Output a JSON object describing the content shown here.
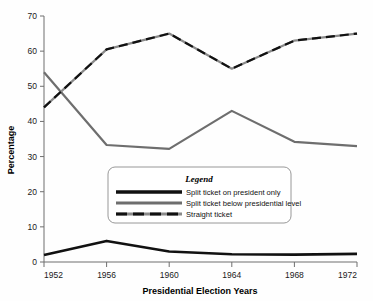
{
  "chart_data": {
    "type": "line",
    "title": "",
    "xlabel": "Presidential Election Years",
    "ylabel": "Percentage",
    "categories": [
      1952,
      1956,
      1960,
      1964,
      1968,
      1972
    ],
    "x_tick_labels": [
      "1952",
      "1956",
      "1960",
      "1964",
      "1968",
      "1972"
    ],
    "y_tick_labels": [
      "0",
      "10",
      "20",
      "30",
      "40",
      "50",
      "60",
      "70"
    ],
    "y_ticks": [
      0,
      10,
      20,
      30,
      40,
      50,
      60,
      70
    ],
    "ylim": [
      0,
      70
    ],
    "xlim": [
      1952,
      1972
    ],
    "grid": false,
    "legend_position": "inside-center",
    "legend_title": "Legend",
    "series": [
      {
        "name": "Split ticket on president only",
        "style": "solid",
        "color": "#111111",
        "width": 2.6,
        "values": [
          2,
          6,
          3,
          2.2,
          2.1,
          2.3
        ]
      },
      {
        "name": "Split ticket below presidential level",
        "style": "solid",
        "color": "#6e6e6e",
        "width": 2.2,
        "values": [
          54,
          33.3,
          32.2,
          43,
          34.2,
          33
        ]
      },
      {
        "name": "Straight ticket",
        "style": "dashed",
        "color": "#111111",
        "color_alt": "#8a8a8a",
        "width": 2.2,
        "values": [
          44,
          60.5,
          65,
          55,
          63,
          65
        ]
      }
    ]
  }
}
